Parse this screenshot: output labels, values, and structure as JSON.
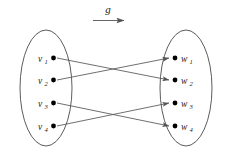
{
  "figure": {
    "title": "",
    "background_color": "#ffffff",
    "stroke_color": "#555555",
    "node_color": "#000000",
    "ellipse_stroke_color": "#4a4a4a"
  },
  "mapping_label": {
    "text": "g",
    "arrow_direction": "right"
  },
  "domain_set": {
    "name": "left-set",
    "nodes": [
      {
        "base": "v",
        "sub": "1",
        "cx": 53.5,
        "cy": 58
      },
      {
        "base": "v",
        "sub": "2",
        "cx": 53.5,
        "cy": 80
      },
      {
        "base": "v",
        "sub": "3",
        "cx": 53.5,
        "cy": 103
      },
      {
        "base": "v",
        "sub": "4",
        "cx": 53.5,
        "cy": 126
      }
    ],
    "ellipse": {
      "cx": 46,
      "cy": 88,
      "rx": 26,
      "ry": 58
    }
  },
  "codomain_set": {
    "name": "right-set",
    "nodes": [
      {
        "base": "w",
        "sub": "1",
        "cx": 175,
        "cy": 58
      },
      {
        "base": "w",
        "sub": "2",
        "cx": 175,
        "cy": 80
      },
      {
        "base": "w",
        "sub": "3",
        "cx": 175,
        "cy": 103
      },
      {
        "base": "w",
        "sub": "4",
        "cx": 175,
        "cy": 126
      }
    ],
    "ellipse": {
      "cx": 186,
      "cy": 88,
      "rx": 26,
      "ry": 58
    }
  },
  "edges": [
    {
      "from": "v1",
      "to": "w2",
      "x1": 57,
      "y1": 58,
      "x2": 170,
      "y2": 80
    },
    {
      "from": "v2",
      "to": "w1",
      "x1": 57,
      "y1": 80,
      "x2": 170,
      "y2": 58
    },
    {
      "from": "v3",
      "to": "w4",
      "x1": 57,
      "y1": 103,
      "x2": 170,
      "y2": 126
    },
    {
      "from": "v4",
      "to": "w3",
      "x1": 57,
      "y1": 126,
      "x2": 170,
      "y2": 103
    }
  ]
}
